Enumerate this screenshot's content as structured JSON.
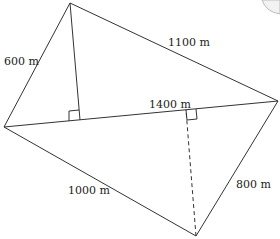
{
  "diagram": {
    "type": "quadrilateral-with-diagonal",
    "vertices": {
      "top": [
        70,
        3
      ],
      "left": [
        4,
        127
      ],
      "right": [
        278,
        101
      ],
      "bottom": [
        196,
        236
      ]
    },
    "labels": {
      "top_left_side": "600 m",
      "top_right_side": "1100 m",
      "diagonal": "1400 m",
      "bottom_left_side": "1000 m",
      "bottom_right_side": "800 m"
    },
    "heights": [
      {
        "from": "top",
        "foot": [
          75,
          117
        ],
        "style": "solid",
        "right_angle_marker": true
      },
      {
        "from": "bottom",
        "foot": [
          186,
          109
        ],
        "style": "dashed",
        "right_angle_marker": true
      }
    ],
    "colors": {
      "line": "#333333",
      "text": "#222222",
      "background": "#ffffff"
    }
  }
}
